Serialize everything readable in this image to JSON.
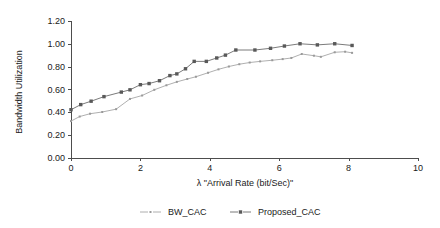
{
  "chart_data": {
    "type": "line",
    "title": "",
    "xlabel": "λ \"Arrival Rate (bit/Sec)\"",
    "ylabel": "Bandwidth Utilization",
    "xlim": [
      0,
      10
    ],
    "ylim": [
      0,
      1.2
    ],
    "xticks": [
      0,
      2,
      4,
      6,
      8,
      10
    ],
    "xtick_labels": [
      "0",
      "2",
      "4",
      "6",
      "8",
      "10"
    ],
    "yticks": [
      0.0,
      0.2,
      0.4,
      0.6,
      0.8,
      1.0,
      1.2
    ],
    "ytick_labels": [
      "0.00",
      "0.20",
      "0.40",
      "0.60",
      "0.80",
      "1.00",
      "1.20"
    ],
    "grid": false,
    "legend_position": "below",
    "series": [
      {
        "name": "BW_CAC",
        "color": "#9a9a9a",
        "marker": "square",
        "marker_size": 2.0,
        "points": [
          [
            0.0,
            0.32
          ],
          [
            0.25,
            0.36
          ],
          [
            0.55,
            0.385
          ],
          [
            0.9,
            0.4
          ],
          [
            1.3,
            0.425
          ],
          [
            1.7,
            0.515
          ],
          [
            2.05,
            0.545
          ],
          [
            2.4,
            0.595
          ],
          [
            2.75,
            0.635
          ],
          [
            3.05,
            0.665
          ],
          [
            3.35,
            0.69
          ],
          [
            3.6,
            0.71
          ],
          [
            3.95,
            0.745
          ],
          [
            4.25,
            0.775
          ],
          [
            4.55,
            0.8
          ],
          [
            4.85,
            0.82
          ],
          [
            5.15,
            0.835
          ],
          [
            5.45,
            0.845
          ],
          [
            5.8,
            0.855
          ],
          [
            6.1,
            0.865
          ],
          [
            6.35,
            0.875
          ],
          [
            6.65,
            0.91
          ],
          [
            7.0,
            0.895
          ],
          [
            7.2,
            0.885
          ],
          [
            7.6,
            0.925
          ],
          [
            7.9,
            0.93
          ],
          [
            8.1,
            0.92
          ]
        ]
      },
      {
        "name": "Proposed_CAC",
        "color": "#595959",
        "marker": "square",
        "marker_size": 3.4,
        "points": [
          [
            0.0,
            0.42
          ],
          [
            0.28,
            0.465
          ],
          [
            0.58,
            0.495
          ],
          [
            0.95,
            0.535
          ],
          [
            1.45,
            0.575
          ],
          [
            1.7,
            0.595
          ],
          [
            2.0,
            0.64
          ],
          [
            2.25,
            0.65
          ],
          [
            2.55,
            0.675
          ],
          [
            2.85,
            0.72
          ],
          [
            3.05,
            0.735
          ],
          [
            3.3,
            0.78
          ],
          [
            3.55,
            0.845
          ],
          [
            3.9,
            0.845
          ],
          [
            4.2,
            0.875
          ],
          [
            4.45,
            0.9
          ],
          [
            4.75,
            0.945
          ],
          [
            5.3,
            0.945
          ],
          [
            5.75,
            0.96
          ],
          [
            6.15,
            0.98
          ],
          [
            6.6,
            1.0
          ],
          [
            7.1,
            0.99
          ],
          [
            7.6,
            1.0
          ],
          [
            8.1,
            0.985
          ]
        ]
      }
    ]
  },
  "legend": {
    "items": [
      {
        "label": "BW_CAC",
        "color": "#9a9a9a"
      },
      {
        "label": "Proposed_CAC",
        "color": "#595959"
      }
    ]
  }
}
